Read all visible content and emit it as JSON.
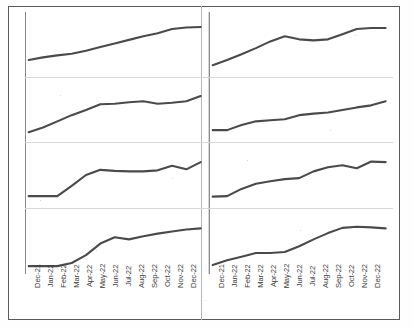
{
  "figure": {
    "title": "",
    "layout": "2 columns x 4 rows small multiples",
    "line_color": "#4a4a4a",
    "frame_color": "#5a5a5a",
    "gridline_color": "#d8d8d8",
    "background": "#ffffff"
  },
  "axis": {
    "categories": [
      "Dec-21",
      "Jan-22",
      "Feb-22",
      "Mar-22",
      "Apr-22",
      "May-22",
      "Jun-22",
      "Jul-22",
      "Aug-22",
      "Sep-22",
      "Oct-22",
      "Nov-22",
      "Dec-22"
    ],
    "label_rotation": "-90",
    "ylabel": "",
    "xlabel": "",
    "grid": true
  },
  "chart_data": [
    {
      "type": "line",
      "id": "panel-1",
      "position": "row1-col1",
      "title": "",
      "xlabel": "",
      "ylabel": "",
      "legend": [],
      "x": [
        "Dec-21",
        "Jan-22",
        "Feb-22",
        "Mar-22",
        "Apr-22",
        "May-22",
        "Jun-22",
        "Jul-22",
        "Aug-22",
        "Sep-22",
        "Oct-22",
        "Nov-22",
        "Dec-22"
      ],
      "values": [
        22,
        27,
        31,
        34,
        40,
        47,
        54,
        61,
        68,
        74,
        82,
        85,
        86
      ],
      "ylim": [
        0,
        100
      ]
    },
    {
      "type": "line",
      "id": "panel-2",
      "position": "row1-col2",
      "title": "",
      "xlabel": "",
      "ylabel": "",
      "legend": [],
      "x": [
        "Dec-21",
        "Jan-22",
        "Feb-22",
        "Mar-22",
        "Apr-22",
        "May-22",
        "Jun-22",
        "Jul-22",
        "Aug-22",
        "Sep-22",
        "Oct-22",
        "Nov-22",
        "Dec-22"
      ],
      "values": [
        12,
        22,
        33,
        45,
        58,
        68,
        62,
        60,
        62,
        72,
        82,
        84,
        84
      ],
      "ylim": [
        0,
        100
      ]
    },
    {
      "type": "line",
      "id": "panel-3",
      "position": "row2-col1",
      "title": "",
      "xlabel": "",
      "ylabel": "",
      "legend": [],
      "x": [
        "Dec-21",
        "Jan-22",
        "Feb-22",
        "Mar-22",
        "Apr-22",
        "May-22",
        "Jun-22",
        "Jul-22",
        "Aug-22",
        "Sep-22",
        "Oct-22",
        "Nov-22",
        "Dec-22"
      ],
      "values": [
        10,
        19,
        31,
        43,
        53,
        64,
        65,
        68,
        70,
        65,
        67,
        70,
        80
      ],
      "ylim": [
        0,
        100
      ]
    },
    {
      "type": "line",
      "id": "panel-4",
      "position": "row2-col2",
      "title": "",
      "xlabel": "",
      "ylabel": "",
      "legend": [],
      "x": [
        "Dec-21",
        "Jan-22",
        "Feb-22",
        "Mar-22",
        "Apr-22",
        "May-22",
        "Jun-22",
        "Jul-22",
        "Aug-22",
        "Sep-22",
        "Oct-22",
        "Nov-22",
        "Dec-22"
      ],
      "values": [
        14,
        14,
        24,
        31,
        33,
        35,
        43,
        46,
        48,
        53,
        58,
        62,
        70
      ],
      "ylim": [
        0,
        100
      ]
    },
    {
      "type": "line",
      "id": "panel-5",
      "position": "row3-col1",
      "title": "",
      "xlabel": "",
      "ylabel": "",
      "legend": [],
      "x": [
        "Dec-21",
        "Jan-22",
        "Feb-22",
        "Mar-22",
        "Apr-22",
        "May-22",
        "Jun-22",
        "Jul-22",
        "Aug-22",
        "Sep-22",
        "Oct-22",
        "Nov-22",
        "Dec-22"
      ],
      "values": [
        12,
        12,
        12,
        32,
        53,
        63,
        61,
        60,
        60,
        62,
        71,
        64,
        78
      ],
      "ylim": [
        0,
        100
      ]
    },
    {
      "type": "line",
      "id": "panel-6",
      "position": "row3-col2",
      "title": "",
      "xlabel": "",
      "ylabel": "",
      "legend": [],
      "x": [
        "Dec-21",
        "Jan-22",
        "Feb-22",
        "Mar-22",
        "Apr-22",
        "May-22",
        "Jun-22",
        "Jul-22",
        "Aug-22",
        "Sep-22",
        "Oct-22",
        "Nov-22",
        "Dec-22"
      ],
      "values": [
        11,
        12,
        26,
        36,
        41,
        45,
        47,
        60,
        68,
        72,
        66,
        79,
        78
      ],
      "ylim": [
        0,
        100
      ]
    },
    {
      "type": "line",
      "id": "panel-7",
      "position": "row4-col1",
      "title": "",
      "xlabel": "",
      "ylabel": "",
      "legend": [],
      "x": [
        "Dec-21",
        "Jan-22",
        "Feb-22",
        "Mar-22",
        "Apr-22",
        "May-22",
        "Jun-22",
        "Jul-22",
        "Aug-22",
        "Sep-22",
        "Oct-22",
        "Nov-22",
        "Dec-22"
      ],
      "values": [
        6,
        6,
        6,
        12,
        27,
        49,
        61,
        57,
        63,
        68,
        72,
        76,
        78
      ],
      "ylim": [
        0,
        100
      ]
    },
    {
      "type": "line",
      "id": "panel-8",
      "position": "row4-col2",
      "title": "",
      "xlabel": "",
      "ylabel": "",
      "legend": [],
      "x": [
        "Dec-21",
        "Jan-22",
        "Feb-22",
        "Mar-22",
        "Apr-22",
        "May-22",
        "Jun-22",
        "Jul-22",
        "Aug-22",
        "Sep-22",
        "Oct-22",
        "Nov-22",
        "Dec-22"
      ],
      "values": [
        8,
        17,
        24,
        31,
        31,
        33,
        44,
        57,
        69,
        79,
        81,
        80,
        78
      ],
      "ylim": [
        0,
        100
      ]
    }
  ]
}
